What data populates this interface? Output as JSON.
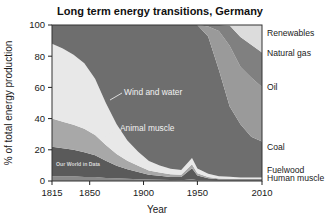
{
  "chart_data": {
    "type": "area",
    "title": "Long term energy transitions, Germany",
    "xlabel": "Year",
    "ylabel": "% of total energy production",
    "xlim": [
      1815,
      2010
    ],
    "ylim": [
      0,
      100
    ],
    "grid": false,
    "legend_position": "right-outside",
    "xticks": [
      "1815",
      "1850",
      "1900",
      "1950",
      "2010"
    ],
    "xtick_values": [
      1815,
      1850,
      1900,
      1950,
      2010
    ],
    "yticks": [
      "0",
      "20",
      "40",
      "60",
      "80",
      "100"
    ],
    "ytick_values": [
      0,
      20,
      40,
      60,
      80,
      100
    ],
    "stacked": true,
    "stack_order_bottom_to_top": [
      "Human muscle",
      "Fuelwood",
      "Animal muscle",
      "Wind and water",
      "Coal",
      "Oil",
      "Natural gas",
      "Renewables"
    ],
    "x": [
      1815,
      1825,
      1835,
      1845,
      1855,
      1865,
      1875,
      1885,
      1895,
      1905,
      1915,
      1925,
      1935,
      1945,
      1950,
      1960,
      1970,
      1980,
      1990,
      2000,
      2010
    ],
    "series": [
      {
        "name": "Human muscle",
        "color": "#8a8a8a",
        "values": [
          3,
          3,
          3,
          2.5,
          2.5,
          2,
          1.8,
          1.5,
          1.2,
          1,
          0.8,
          0.6,
          0.5,
          1.2,
          0.5,
          0.3,
          0.2,
          0.2,
          0.1,
          0.1,
          0.1
        ]
      },
      {
        "name": "Fuelwood",
        "color": "#5a5a5a",
        "values": [
          19,
          18,
          17,
          16,
          14,
          11,
          8,
          6,
          4.5,
          3,
          2.5,
          2,
          2,
          7,
          3,
          1.5,
          1,
          1,
          1,
          1,
          1
        ]
      },
      {
        "name": "Animal muscle",
        "color": "#a8a8a8",
        "values": [
          18,
          17,
          16,
          15,
          13,
          10,
          7.5,
          5.5,
          4,
          2.8,
          2.2,
          1.8,
          1.5,
          2.5,
          1.5,
          0.8,
          0.4,
          0.3,
          0.2,
          0.2,
          0.2
        ]
      },
      {
        "name": "Wind and water",
        "color": "#e8e8e8",
        "values": [
          48,
          47,
          45,
          42,
          36,
          27,
          19,
          13,
          9,
          6,
          4.5,
          3.5,
          3,
          4,
          3,
          2,
          1.5,
          1.2,
          1,
          1,
          1
        ]
      },
      {
        "name": "Coal",
        "color": "#6e6e6e",
        "values": [
          12,
          15,
          19,
          24.5,
          34.5,
          50,
          63.7,
          74,
          81.3,
          87.2,
          90,
          92.1,
          93,
          85.3,
          92,
          88,
          68,
          45,
          34,
          26,
          23
        ]
      },
      {
        "name": "Oil",
        "color": "#9a9a9a",
        "values": [
          0,
          0,
          0,
          0,
          0,
          0,
          0,
          0,
          0,
          0,
          0,
          0,
          0,
          0,
          0,
          6.4,
          25,
          39,
          37,
          38,
          35
        ]
      },
      {
        "name": "Natural gas",
        "color": "#808080",
        "values": [
          0,
          0,
          0,
          0,
          0,
          0,
          0,
          0,
          0,
          0,
          0,
          0,
          0,
          0,
          0,
          1,
          3.9,
          13,
          19,
          21,
          22
        ]
      },
      {
        "name": "Renewables",
        "color": "#dcdcdc",
        "values": [
          0,
          0,
          0,
          0,
          0,
          0,
          0,
          0,
          0,
          0,
          0,
          0,
          0,
          0,
          0,
          0,
          0,
          0.3,
          7.7,
          12.7,
          17.7
        ]
      }
    ],
    "right_labels": [
      {
        "text": "Renewables",
        "y_pct": 95
      },
      {
        "text": "Natural gas",
        "y_pct": 82
      },
      {
        "text": "Oil",
        "y_pct": 60
      },
      {
        "text": "Coal",
        "y_pct": 22
      },
      {
        "text": "Fuelwood",
        "y_pct": 7
      },
      {
        "text": "Human muscle",
        "y_pct": 2
      }
    ],
    "annotations": [
      {
        "text": "Wind and water",
        "x": 1868,
        "y_pct": 70
      },
      {
        "text": "Animal muscle",
        "x": 1880,
        "y_pct": 42
      }
    ],
    "watermark": "Our World in Data"
  }
}
